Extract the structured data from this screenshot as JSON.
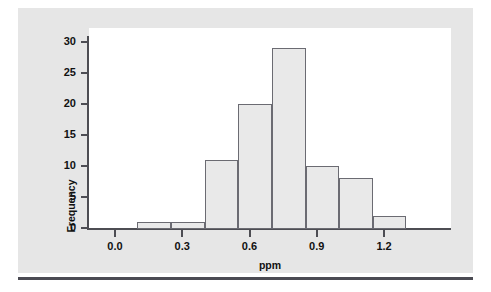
{
  "figure": {
    "background_color": "#e6e6e6",
    "plot_background_color": "#ffffff",
    "rule_color": "#4a4a52"
  },
  "chart_data": {
    "type": "bar",
    "title": "",
    "subtitle": "",
    "xlabel": "ppm",
    "ylabel": "Frequency",
    "xlim": [
      -0.09,
      1.53
    ],
    "ylim": [
      0,
      31
    ],
    "grid": false,
    "legend": null,
    "x_tick_labels": [
      "0.0",
      "0.3",
      "0.6",
      "0.9",
      "1.2"
    ],
    "x_tick_values": [
      0.0,
      0.3,
      0.6,
      0.9,
      1.2
    ],
    "y_tick_labels": [
      "0",
      "5",
      "10",
      "15",
      "20",
      "25",
      "30"
    ],
    "y_tick_values": [
      0,
      5,
      10,
      15,
      20,
      25,
      30
    ],
    "bin_width": 0.15,
    "bin_edges": [
      0.1,
      0.25,
      0.4,
      0.55,
      0.7,
      0.85,
      1.0,
      1.15,
      1.3
    ],
    "bin_centers": [
      0.175,
      0.325,
      0.475,
      0.625,
      0.775,
      0.925,
      1.075,
      1.225
    ],
    "categories": [
      "0.10-0.25",
      "0.25-0.40",
      "0.40-0.55",
      "0.55-0.70",
      "0.70-0.85",
      "0.85-1.00",
      "1.00-1.15",
      "1.15-1.30"
    ],
    "values": [
      1,
      1,
      11,
      20,
      29,
      10,
      8,
      2
    ],
    "total_count": 82,
    "bar_fill_color": "#e9e9e9",
    "bar_edge_color": "#6b6b72",
    "axis_color": "#4d4d53"
  }
}
